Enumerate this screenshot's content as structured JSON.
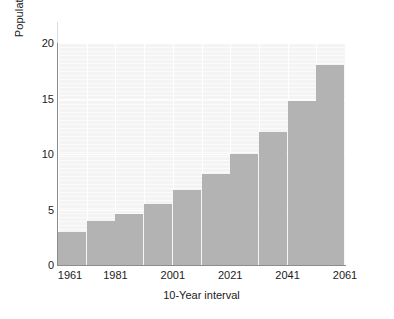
{
  "chart_data": {
    "type": "bar",
    "title": "",
    "xlabel": "10-Year interval",
    "ylabel": "Population in billions",
    "categories": [
      "1961",
      "1971",
      "1981",
      "1991",
      "2001",
      "2011",
      "2021",
      "2031",
      "2041",
      "2051"
    ],
    "values": [
      3,
      4,
      4.6,
      5.5,
      6.8,
      8.2,
      10,
      12,
      14.8,
      18
    ],
    "x_tick_labels": [
      "1961",
      "1981",
      "2001",
      "2021",
      "2041",
      "2061"
    ],
    "x_tick_positions": [
      0,
      2,
      4,
      6,
      8,
      10
    ],
    "y_tick_labels": [
      "0",
      "5",
      "10",
      "15",
      "20"
    ],
    "y_tick_values": [
      0,
      5,
      10,
      15,
      20
    ],
    "ylim": [
      0,
      20
    ],
    "grid": true,
    "legend": "none",
    "bar_color": "#b3b3b3",
    "plot_background": "#f4f4f4",
    "gridline_color": "#ffffff",
    "axis_color": "#8c8c8c",
    "text_color": "#1a1a1a"
  }
}
